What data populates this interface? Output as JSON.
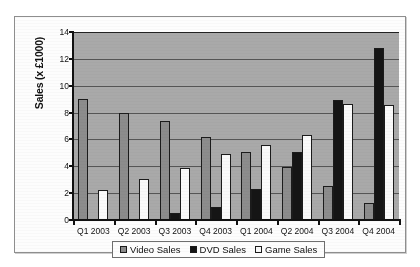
{
  "chart_data": {
    "type": "bar",
    "title": "",
    "xlabel": "",
    "ylabel": "Sales (x £1000)",
    "ylim": [
      0,
      14
    ],
    "ytick_step": 2,
    "yticks": [
      "0",
      "2",
      "4",
      "6",
      "8",
      "10",
      "12",
      "14"
    ],
    "grid": true,
    "legend_position": "bottom",
    "categories": [
      "Q1 2003",
      "Q2 2003",
      "Q3 2003",
      "Q4 2003",
      "Q1 2004",
      "Q2 2004",
      "Q3 2004",
      "Q4 2004"
    ],
    "series": [
      {
        "name": "Video Sales",
        "color": "#8c8c8c",
        "values": [
          9.0,
          8.0,
          7.4,
          6.15,
          5.1,
          3.95,
          2.5,
          1.3
        ]
      },
      {
        "name": "DVD Sales",
        "color": "#151515",
        "values": [
          0,
          0,
          0.5,
          0.95,
          2.3,
          5.1,
          8.95,
          12.8
        ]
      },
      {
        "name": "Game Sales",
        "color": "#fafafa",
        "values": [
          2.2,
          3.05,
          3.85,
          4.95,
          5.6,
          6.3,
          8.65,
          8.6
        ]
      }
    ]
  },
  "legend": {
    "items": [
      {
        "label": "Video Sales",
        "swatch": "video"
      },
      {
        "label": "DVD Sales",
        "swatch": "dvd"
      },
      {
        "label": "Game Sales",
        "swatch": "game"
      }
    ]
  }
}
